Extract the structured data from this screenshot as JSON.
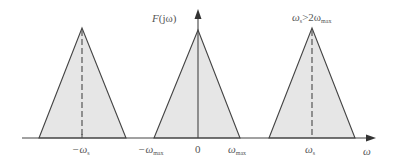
{
  "diagram": {
    "ylabel": {
      "main": "F",
      "paren": "(jω)"
    },
    "xlabel": "ω",
    "condition": {
      "left": "ω",
      "left_sub": "s",
      "op": ">2ω",
      "right_sub": "max"
    },
    "ticks": [
      {
        "id": "neg_ws",
        "text": "−ω",
        "sub": "s"
      },
      {
        "id": "neg_wmax",
        "text": "−ω",
        "sub": "max"
      },
      {
        "id": "zero",
        "text": "0",
        "sub": ""
      },
      {
        "id": "wmax",
        "text": "ω",
        "sub": "max"
      },
      {
        "id": "ws",
        "text": "ω",
        "sub": "s"
      }
    ],
    "spectra": [
      {
        "name": "replica-negative-ws",
        "center_label": "−ωs",
        "dashed_center": true
      },
      {
        "name": "baseband",
        "center_label": "0",
        "dashed_center": false
      },
      {
        "name": "replica-positive-ws",
        "center_label": "ωs",
        "dashed_center": true
      }
    ],
    "colors": {
      "fill": "#e6e6e6",
      "stroke": "#444444",
      "text": "#555555"
    }
  }
}
